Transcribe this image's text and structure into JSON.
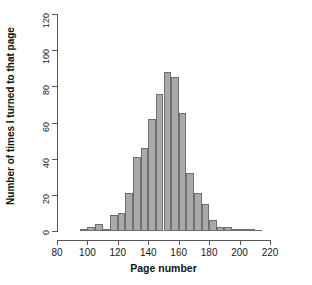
{
  "chart_data": {
    "type": "bar",
    "subtype": "histogram",
    "title": "",
    "xlabel": "Page number",
    "ylabel": "Number of times I turned to that page",
    "xlim": [
      80,
      220
    ],
    "ylim": [
      0,
      120
    ],
    "xticks": [
      80,
      100,
      120,
      140,
      160,
      180,
      200,
      220
    ],
    "yticks": [
      0,
      20,
      40,
      60,
      80,
      100,
      120
    ],
    "bin_width": 5,
    "grid": false,
    "legend": null,
    "bar_color": "#a9a9a9",
    "bar_border_color": "#6e6e6e",
    "axis_color": "#565656",
    "background": "#ffffff",
    "bins": [
      {
        "start": 95,
        "end": 100,
        "center": 97.5,
        "value": 1
      },
      {
        "start": 100,
        "end": 105,
        "center": 102.5,
        "value": 2
      },
      {
        "start": 105,
        "end": 110,
        "center": 107.5,
        "value": 4
      },
      {
        "start": 110,
        "end": 115,
        "center": 112.5,
        "value": 1
      },
      {
        "start": 115,
        "end": 120,
        "center": 117.5,
        "value": 9
      },
      {
        "start": 120,
        "end": 125,
        "center": 122.5,
        "value": 10
      },
      {
        "start": 125,
        "end": 130,
        "center": 127.5,
        "value": 21
      },
      {
        "start": 130,
        "end": 135,
        "center": 132.5,
        "value": 41
      },
      {
        "start": 135,
        "end": 140,
        "center": 137.5,
        "value": 46
      },
      {
        "start": 140,
        "end": 145,
        "center": 142.5,
        "value": 62
      },
      {
        "start": 145,
        "end": 150,
        "center": 147.5,
        "value": 76
      },
      {
        "start": 150,
        "end": 155,
        "center": 152.5,
        "value": 88
      },
      {
        "start": 155,
        "end": 160,
        "center": 157.5,
        "value": 85
      },
      {
        "start": 160,
        "end": 165,
        "center": 162.5,
        "value": 65
      },
      {
        "start": 165,
        "end": 170,
        "center": 167.5,
        "value": 32
      },
      {
        "start": 170,
        "end": 175,
        "center": 172.5,
        "value": 21
      },
      {
        "start": 175,
        "end": 180,
        "center": 177.5,
        "value": 15
      },
      {
        "start": 180,
        "end": 185,
        "center": 182.5,
        "value": 6
      },
      {
        "start": 185,
        "end": 190,
        "center": 187.5,
        "value": 2
      },
      {
        "start": 190,
        "end": 195,
        "center": 192.5,
        "value": 2
      },
      {
        "start": 195,
        "end": 200,
        "center": 197.5,
        "value": 1
      },
      {
        "start": 200,
        "end": 205,
        "center": 202.5,
        "value": 1
      },
      {
        "start": 205,
        "end": 210,
        "center": 207.5,
        "value": 1
      },
      {
        "start": 210,
        "end": 215,
        "center": 212.5,
        "value": 0
      }
    ]
  }
}
